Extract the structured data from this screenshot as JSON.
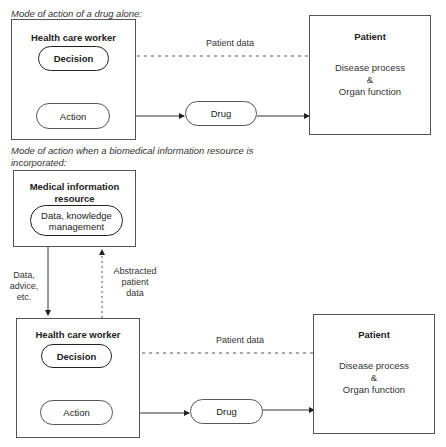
{
  "diagram": {
    "top_section": {
      "caption": "Mode of action of a drug alone:",
      "health_care_worker": {
        "title": "Health care worker",
        "decision": "Decision",
        "action": "Action"
      },
      "drug": "Drug",
      "patient": {
        "title": "Patient",
        "line1": "Disease process",
        "line2": "&",
        "line3": "Organ function"
      },
      "patient_data_label": "Patient data"
    },
    "bottom_section": {
      "caption_line1": "Mode of action when a biomedical information resource is",
      "caption_line2": "incorporated:",
      "medical_info_resource": {
        "title_line1": "Medical information",
        "title_line2": "resource",
        "inner_line1": "Data, knowledge",
        "inner_line2": "management"
      },
      "data_advice_label": {
        "line1": "Data,",
        "line2": "advice,",
        "line3": "etc."
      },
      "abstracted_label": {
        "line1": "Abstracted",
        "line2": "patient",
        "line3": "data"
      },
      "health_care_worker": {
        "title": "Health care worker",
        "decision": "Decision",
        "action": "Action"
      },
      "drug": "Drug",
      "patient": {
        "title": "Patient",
        "line1": "Disease process",
        "line2": "&",
        "line3": "Organ function"
      },
      "patient_data_label": "Patient data"
    }
  }
}
